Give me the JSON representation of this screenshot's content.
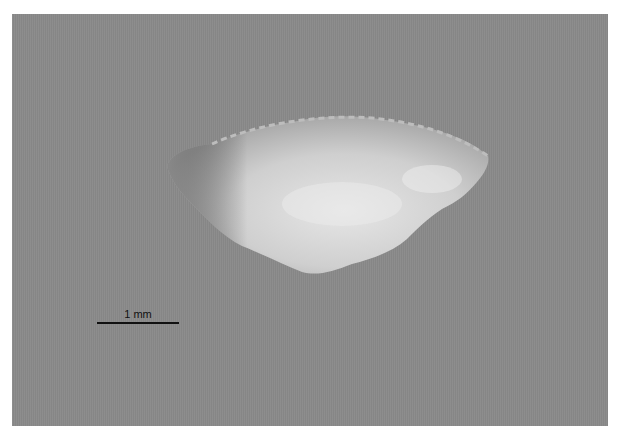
{
  "image": {
    "subject": "translucent shell / scale specimen on gray background",
    "background_color": "#8a8a8a"
  },
  "scale_bar": {
    "label": "1 mm"
  }
}
